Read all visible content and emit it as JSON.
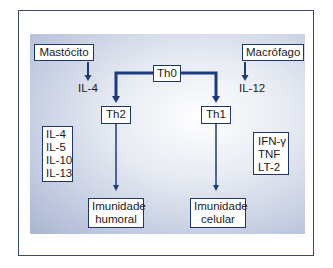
{
  "diagram": {
    "nodes": {
      "mastocito": "Mastócito",
      "macrofago": "Macrófago",
      "th0": "Th0",
      "th2": "Th2",
      "th1": "Th1",
      "imunidade_humoral": [
        "Imunidade",
        "humoral"
      ],
      "imunidade_celular": [
        "Imunidade",
        "celular"
      ]
    },
    "labels": {
      "il4": "IL-4",
      "il12": "IL-12"
    },
    "cytokines_th2": [
      "IL-4",
      "IL-5",
      "IL-10",
      "IL-13"
    ],
    "cytokines_th1": [
      "IFN-γ",
      "TNF",
      "LT-2"
    ],
    "edges": [
      {
        "from": "Mastócito",
        "to": "IL-4"
      },
      {
        "from": "Macrófago",
        "to": "IL-12"
      },
      {
        "from": "Th0",
        "to": "Th2"
      },
      {
        "from": "Th0",
        "to": "Th1"
      },
      {
        "from": "Th2",
        "to": "Imunidade humoral"
      },
      {
        "from": "Th1",
        "to": "Imunidade celular"
      }
    ],
    "colors": {
      "arrow": "#1f3a7a",
      "box_border": "#1f3468",
      "frame_border": "#3b4a6b",
      "panel_edge": "#aab5d1"
    }
  }
}
